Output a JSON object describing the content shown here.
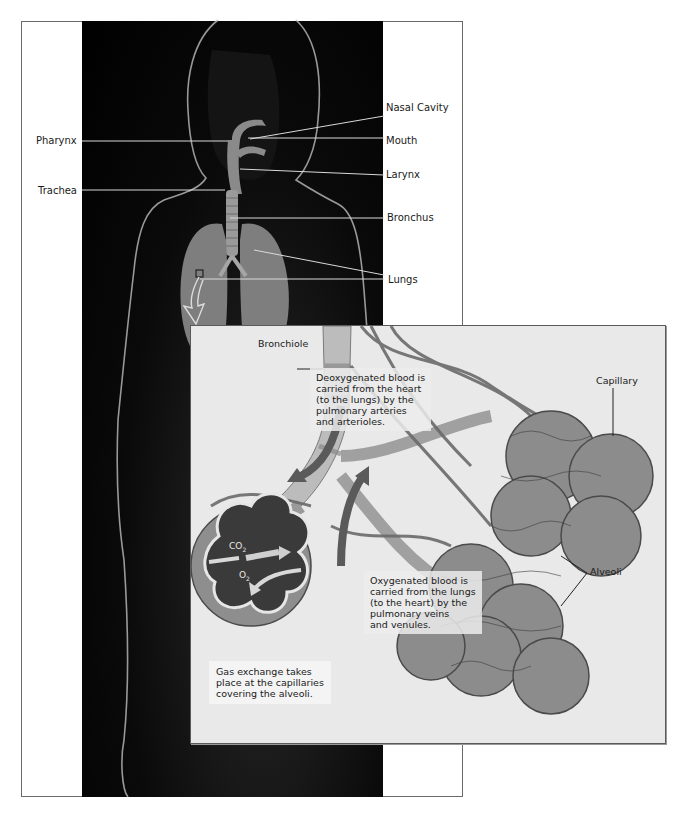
{
  "figure": {
    "colors": {
      "frame_border": "#6a6a6a",
      "photo_background": "#000000",
      "inset_background": "#e9e9e9",
      "organ_gray": "#8a8a8a",
      "label_line": "#d9d9d9",
      "text": "#1a1a1a"
    }
  },
  "body_labels": {
    "left": [
      {
        "text": "Pharynx"
      },
      {
        "text": "Trachea"
      }
    ],
    "right": [
      {
        "text": "Nasal Cavity"
      },
      {
        "text": "Mouth"
      },
      {
        "text": "Larynx"
      },
      {
        "text": "Bronchus"
      },
      {
        "text": "Lungs"
      }
    ]
  },
  "inset": {
    "labels": {
      "bronchiole": "Bronchiole",
      "capillary": "Capillary",
      "alveoli": "Alveoli",
      "co2": "CO",
      "co2_sub": "2",
      "o2": "O",
      "o2_sub": "2"
    },
    "notes": {
      "deoxygenated": [
        "Deoxygenated blood is",
        "carried from the heart",
        "(to the lungs) by the",
        "pulmonary arteries",
        "and arterioles."
      ],
      "oxygenated": [
        "Oxygenated blood is",
        "carried from the lungs",
        "(to the heart) by the",
        "pulmonary veins",
        "and venules."
      ],
      "gas_exchange": [
        "Gas exchange takes",
        "place at the capillaries",
        "covering the alveoli."
      ]
    }
  }
}
